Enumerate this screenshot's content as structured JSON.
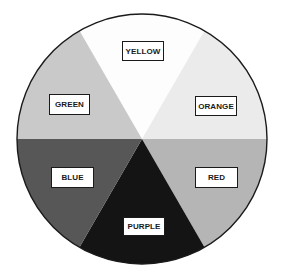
{
  "diagram": {
    "type": "color-wheel",
    "center": [
      142,
      139
    ],
    "radius": 125,
    "outline_color": "#1a1a1a",
    "segments": [
      {
        "label": "YELLOW",
        "fill": "#fdfdfd",
        "start_deg": 60,
        "end_deg": 120,
        "box": {
          "x": 122,
          "y": 41,
          "w": 42,
          "h": 20
        }
      },
      {
        "label": "ORANGE",
        "fill": "#ebebeb",
        "start_deg": 0,
        "end_deg": 60,
        "box": {
          "x": 195,
          "y": 96,
          "w": 42,
          "h": 20
        }
      },
      {
        "label": "RED",
        "fill": "#b5b5b5",
        "start_deg": -60,
        "end_deg": 0,
        "box": {
          "x": 195,
          "y": 167,
          "w": 43,
          "h": 21
        }
      },
      {
        "label": "PURPLE",
        "fill": "#141414",
        "start_deg": -120,
        "end_deg": -60,
        "box": {
          "x": 123,
          "y": 217,
          "w": 42,
          "h": 19
        }
      },
      {
        "label": "BLUE",
        "fill": "#575757",
        "start_deg": 180,
        "end_deg": 240,
        "box": {
          "x": 51,
          "y": 167,
          "w": 43,
          "h": 21
        }
      },
      {
        "label": "GREEN",
        "fill": "#c9c9c9",
        "start_deg": 120,
        "end_deg": 180,
        "box": {
          "x": 49,
          "y": 94,
          "w": 41,
          "h": 21
        }
      }
    ]
  }
}
